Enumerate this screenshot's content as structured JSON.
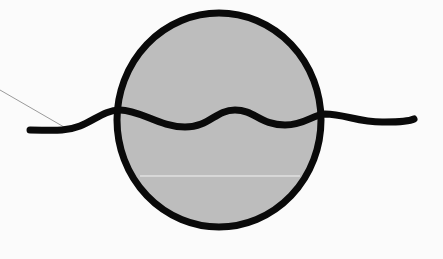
{
  "diagram": {
    "colors": {
      "background": "#fbfbfb",
      "circle_fill": "#bdbdbd",
      "outline": "#0a0a0a",
      "leader_line": "#9a9a9a",
      "highlight_line": "#f2f2f2"
    },
    "circle": {
      "cx": 219,
      "cy": 120,
      "rx": 102,
      "ry": 107
    },
    "elements": [
      "circle",
      "wavy-line",
      "leader-line"
    ]
  }
}
